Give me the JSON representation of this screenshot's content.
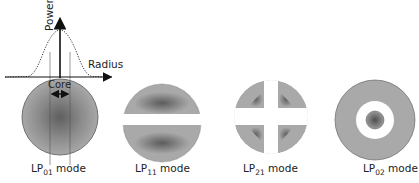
{
  "figure": {
    "graph": {
      "y_axis_label": "Power",
      "x_axis_label": "Radius",
      "core_label": "Core",
      "core_arrow": "double-arrow"
    },
    "modes": [
      {
        "prefix": "LP",
        "subscript": "01",
        "suffix": " mode",
        "pattern": "single-lobe"
      },
      {
        "prefix": "LP",
        "subscript": "11",
        "suffix": " mode",
        "pattern": "two-lobes-horizontal-gap"
      },
      {
        "prefix": "LP",
        "subscript": "21",
        "suffix": " mode",
        "pattern": "four-quadrants"
      },
      {
        "prefix": "LP",
        "subscript": "02",
        "suffix": " mode",
        "pattern": "center-spot-with-ring"
      }
    ],
    "colors": {
      "mode_fill_outer": "#a9a9a9",
      "mode_fill_inner": "#5f5f5f",
      "outline": "#555555",
      "axis": "#111111"
    }
  }
}
